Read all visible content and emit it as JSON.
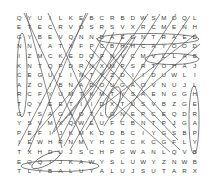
{
  "puzzle": {
    "title": "word-search-grid",
    "rows": 17,
    "cols": 18,
    "letter_color": "#3c3c3c",
    "marker_color": "#555555",
    "background": "#ffffff",
    "grid": [
      [
        "Q",
        "Y",
        "U",
        "I",
        "L",
        "K",
        "E",
        "B",
        "C",
        "R",
        "B",
        "D",
        "W",
        "S",
        "M",
        "O",
        "Q",
        "L"
      ],
      [
        "E",
        "T",
        "E",
        "C",
        "R",
        "V",
        "O",
        "S",
        "R",
        "S",
        "V",
        "X",
        "R",
        "C",
        "M",
        "E",
        "N",
        "H"
      ],
      [
        "G",
        "Y",
        "B",
        "E",
        "V",
        "Q",
        "N",
        "N",
        "D",
        "A",
        "E",
        "G",
        "N",
        "T",
        "R",
        "A",
        "E",
        "D"
      ],
      [
        "N",
        "N",
        "Y",
        "A",
        "T",
        "X",
        "F",
        "P",
        "C",
        "B",
        "H",
        "H",
        "C",
        "A",
        "Y",
        "O",
        "O",
        "D"
      ],
      [
        "I",
        "Z",
        "M",
        "C",
        "K",
        "E",
        "D",
        "Q",
        "F",
        "N",
        "V",
        "C",
        "M",
        "V",
        "L",
        "L",
        "A",
        "B"
      ],
      [
        "K",
        "N",
        "T",
        "Q",
        "P",
        "D",
        "R",
        "N",
        "X",
        "M",
        "P",
        "S",
        "R",
        "T",
        "O",
        "H",
        "A",
        "J"
      ],
      [
        "C",
        "E",
        "G",
        "U",
        "L",
        "I",
        "N",
        "T",
        "Y",
        "Z",
        "D",
        "I",
        "I",
        "D",
        "U",
        "W",
        "L",
        "I"
      ],
      [
        "A",
        "Z",
        "O",
        "I",
        "B",
        "N",
        "A",
        "D",
        "O",
        "U",
        "G",
        "A",
        "O",
        "V",
        "N",
        "U",
        "J",
        "L"
      ],
      [
        "R",
        "C",
        "F",
        "Y",
        "U",
        "M",
        "T",
        "K",
        "M",
        "T",
        "Y",
        "S",
        "A",
        "E",
        "N",
        "G",
        "G",
        "H"
      ],
      [
        "T",
        "Q",
        "Y",
        "E",
        "E",
        "T",
        "I",
        "I",
        "D",
        "X",
        "T",
        "U",
        "S",
        "V",
        "B",
        "Z",
        "G",
        "E"
      ],
      [
        "G",
        "T",
        "S",
        "A",
        "G",
        "A",
        "O",
        "T",
        "L",
        "G",
        "N",
        "E",
        "P",
        "C",
        "E",
        "Q",
        "D",
        "R"
      ],
      [
        "Y",
        "S",
        "V",
        "M",
        "X",
        "Q",
        "W",
        "E",
        "U",
        "F",
        "C",
        "B",
        "N",
        "T",
        "P",
        "J",
        "G",
        "A"
      ],
      [
        "P",
        "E",
        "F",
        "I",
        "J",
        "K",
        "M",
        "K",
        "D",
        "D",
        "B",
        "C",
        "I",
        "Y",
        "G",
        "S",
        "B",
        "P"
      ],
      [
        "I",
        "E",
        "W",
        "H",
        "R",
        "N",
        "M",
        "Y",
        "H",
        "C",
        "C",
        "C",
        "K",
        "C",
        "G",
        "F",
        "L",
        "Y"
      ],
      [
        "T",
        "X",
        "H",
        "D",
        "U",
        "J",
        "S",
        "C",
        "H",
        "P",
        "G",
        "W",
        "A",
        "N",
        "L",
        "Q",
        "V",
        "B"
      ],
      [
        "E",
        "Q",
        "Q",
        "I",
        "J",
        "K",
        "A",
        "W",
        "Y",
        "S",
        "L",
        "U",
        "W",
        "Y",
        "Z",
        "N",
        "W",
        "B"
      ],
      [
        "T",
        "L",
        "Y",
        "B",
        "A",
        "L",
        "U",
        "Y",
        "A",
        "L",
        "U",
        "J",
        "S",
        "U",
        "T",
        "A",
        "R",
        "X"
      ]
    ],
    "extra_row": [
      "N",
      "X",
      "O",
      "F",
      "T",
      "Z",
      "O",
      "X",
      "V",
      "L",
      "Z",
      "C",
      "S",
      "N",
      "Z",
      "Z",
      "A",
      "Z"
    ],
    "found_words": [
      {
        "text": "DAEGNTRAE",
        "direction": "horizontal",
        "row": 3,
        "shape": "ellipse"
      },
      {
        "text": "LLAB",
        "direction": "horizontal",
        "row": 5,
        "shape": "ellipse"
      },
      {
        "text": "NIKCART",
        "direction": "vertical",
        "col": 1,
        "shape": "ellipse"
      },
      {
        "text": "THERAPY",
        "direction": "vertical",
        "col": 18,
        "shape": "ellipse"
      },
      {
        "text": "LYBAL",
        "direction": "horizontal",
        "row": 17,
        "shape": "ellipse"
      }
    ],
    "marker_count": 18
  }
}
